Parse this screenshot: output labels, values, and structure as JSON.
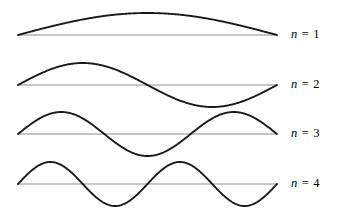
{
  "figure": {
    "background_color": "#ffffff",
    "width": 337,
    "height": 224,
    "wave_color": "#1a1a1a",
    "baseline_color": "#8c8c8c",
    "wave_stroke_width": 1.9,
    "baseline_stroke_width": 1.0
  },
  "chart_data": {
    "type": "line",
    "title": "",
    "xlabel": "",
    "ylabel": "",
    "grid": false,
    "legend": "right",
    "axis_x_start": 18,
    "axis_x_end": 277,
    "amplitude_px": 22,
    "series": [
      {
        "name": "n = 1",
        "harmonic": 1,
        "half_periods": 1,
        "baseline_y": 35,
        "amplitude": 22,
        "label_x": 291,
        "label_y": 35
      },
      {
        "name": "n = 2",
        "harmonic": 2,
        "half_periods": 2,
        "baseline_y": 85,
        "amplitude": 22,
        "label_x": 291,
        "label_y": 85
      },
      {
        "name": "n = 3",
        "harmonic": 3,
        "half_periods": 3,
        "baseline_y": 134,
        "amplitude": 22,
        "label_x": 291,
        "label_y": 134
      },
      {
        "name": "n = 4",
        "harmonic": 4,
        "half_periods": 4,
        "baseline_y": 184,
        "amplitude": 22,
        "label_x": 291,
        "label_y": 184
      }
    ]
  },
  "labels": [
    {
      "variable": "n",
      "equals": "=",
      "value": "1",
      "text": "n = 1"
    },
    {
      "variable": "n",
      "equals": "=",
      "value": "2",
      "text": "n = 2"
    },
    {
      "variable": "n",
      "equals": "=",
      "value": "3",
      "text": "n = 3"
    },
    {
      "variable": "n",
      "equals": "=",
      "value": "4",
      "text": "n = 4"
    }
  ]
}
